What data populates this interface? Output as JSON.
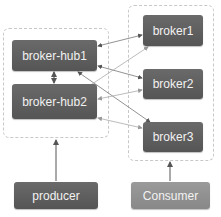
{
  "diagram": {
    "groups": [
      {
        "id": "hub-cluster",
        "label": ""
      },
      {
        "id": "broker-cluster",
        "label": ""
      }
    ],
    "nodes": {
      "hub1": "broker-hub1",
      "hub2": "broker-hub2",
      "broker1": "broker1",
      "broker2": "broker2",
      "broker3": "broker3",
      "producer": "producer",
      "consumer": "Consumer"
    },
    "edges": [
      {
        "from": "broker-hub1",
        "to": "broker-hub2",
        "style": "bidirectional"
      },
      {
        "from": "broker-hub1",
        "to": "broker1",
        "style": "bidirectional"
      },
      {
        "from": "broker-hub1",
        "to": "broker2",
        "style": "bidirectional"
      },
      {
        "from": "broker-hub1",
        "to": "broker3",
        "style": "bidirectional"
      },
      {
        "from": "broker-hub2",
        "to": "broker1",
        "style": "bidirectional"
      },
      {
        "from": "broker-hub2",
        "to": "broker2",
        "style": "bidirectional"
      },
      {
        "from": "broker-hub2",
        "to": "broker3",
        "style": "bidirectional"
      },
      {
        "from": "producer",
        "to": "broker-hub2",
        "style": "arrow"
      },
      {
        "from": "Consumer",
        "to": "broker3",
        "style": "arrow"
      }
    ],
    "colors": {
      "dark_node": "#5e5e5e",
      "light_node": "#8f8f8f",
      "text": "#f2f2f2",
      "dashed_border": "#c8c8c8"
    }
  }
}
